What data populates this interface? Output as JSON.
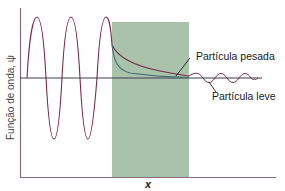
{
  "diagram": {
    "title": "",
    "y_axis_label": "Função de onda, ψ",
    "x_axis_label": "x",
    "labels": {
      "heavy": "Partícula pesada",
      "light": "Partícula leve"
    },
    "colors": {
      "barrier": "#a9c2aa",
      "heavy_curve": "#7a2b4a",
      "light_curve": "#3e6a7a",
      "axis": "#8a6a7e",
      "zero_line": "#3c3c4c"
    },
    "elements": [
      "incident sinusoidal wave (left region)",
      "potential barrier (green rectangle)",
      "decaying wavefunction inside barrier — heavy particle (faster? no: slower decay, dark red)",
      "decaying wavefunction inside barrier — light particle (blue-grey)",
      "small transmitted oscillation (right region)"
    ]
  }
}
